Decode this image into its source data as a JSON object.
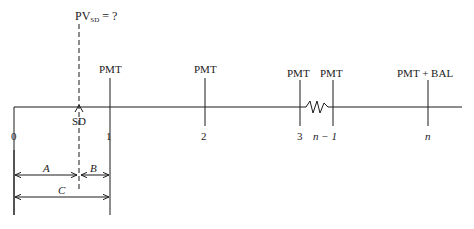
{
  "diagram": {
    "type": "cash-flow-timeline",
    "present_value_label": {
      "prefix": "PV",
      "subscript": "SD",
      "suffix": " = ?"
    },
    "settlement_marker_label": "SD",
    "payments": [
      {
        "period_label": "1",
        "payment_label": "PMT"
      },
      {
        "period_label": "2",
        "payment_label": "PMT"
      },
      {
        "period_label": "3",
        "payment_label": "PMT"
      },
      {
        "period_label": "n − 1",
        "payment_label": "PMT"
      },
      {
        "period_label": "n",
        "payment_label": "PMT + BAL"
      }
    ],
    "origin_label": "0",
    "intervals": {
      "a_label": "A",
      "b_label": "B",
      "c_label": "C"
    },
    "colors": {
      "line": "#1a1a1a",
      "background": "#ffffff"
    }
  }
}
